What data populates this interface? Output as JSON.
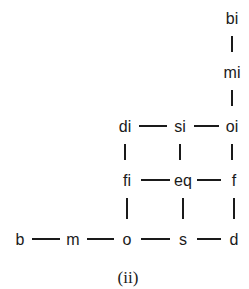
{
  "caption": "(ii)",
  "nodes": [
    {
      "id": "bi",
      "label": "bi"
    },
    {
      "id": "mi",
      "label": "mi"
    },
    {
      "id": "di",
      "label": "di"
    },
    {
      "id": "si",
      "label": "si"
    },
    {
      "id": "oi",
      "label": "oi"
    },
    {
      "id": "fi",
      "label": "fi"
    },
    {
      "id": "eq",
      "label": "eq"
    },
    {
      "id": "f",
      "label": "f"
    },
    {
      "id": "b",
      "label": "b"
    },
    {
      "id": "m",
      "label": "m"
    },
    {
      "id": "o",
      "label": "o"
    },
    {
      "id": "s",
      "label": "s"
    },
    {
      "id": "d",
      "label": "d"
    }
  ],
  "edges": [
    [
      "bi",
      "mi"
    ],
    [
      "mi",
      "oi"
    ],
    [
      "di",
      "si"
    ],
    [
      "si",
      "oi"
    ],
    [
      "di",
      "fi"
    ],
    [
      "si",
      "eq"
    ],
    [
      "oi",
      "f"
    ],
    [
      "fi",
      "eq"
    ],
    [
      "eq",
      "f"
    ],
    [
      "fi",
      "o"
    ],
    [
      "eq",
      "s"
    ],
    [
      "f",
      "d"
    ],
    [
      "b",
      "m"
    ],
    [
      "m",
      "o"
    ],
    [
      "o",
      "s"
    ],
    [
      "s",
      "d"
    ]
  ]
}
